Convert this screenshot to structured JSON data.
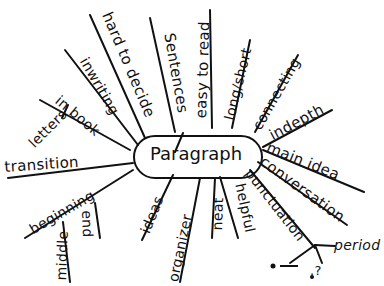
{
  "center": {
    "label": "Paragraph"
  },
  "branches": [
    {
      "id": "letters",
      "label": "letters"
    },
    {
      "id": "in-book",
      "label": "in book"
    },
    {
      "id": "in-writing",
      "label": "inwriting"
    },
    {
      "id": "hard-to-decide",
      "label": "hard to decide"
    },
    {
      "id": "sentences",
      "label": "Sentences"
    },
    {
      "id": "easy-to-read",
      "label": "easy to read"
    },
    {
      "id": "long-short",
      "label": "long/short"
    },
    {
      "id": "connecting",
      "label": "connecting"
    },
    {
      "id": "indepth",
      "label": "indepth"
    },
    {
      "id": "main-idea",
      "label": "main idea"
    },
    {
      "id": "conversation",
      "label": "conversation"
    },
    {
      "id": "punctuation",
      "label": "punctuation"
    },
    {
      "id": "period",
      "label": "period"
    },
    {
      "id": "helpful",
      "label": "helpful"
    },
    {
      "id": "neat",
      "label": "neat"
    },
    {
      "id": "organizer",
      "label": "organizer"
    },
    {
      "id": "ideas",
      "label": "ideas"
    },
    {
      "id": "beginning",
      "label": "beginning"
    },
    {
      "id": "end",
      "label": "end"
    },
    {
      "id": "middle",
      "label": "middle"
    },
    {
      "id": "transition",
      "label": "transition"
    }
  ],
  "punctuation_marks": {
    "dot1": ".",
    "dash": "_",
    "question": ".?"
  }
}
